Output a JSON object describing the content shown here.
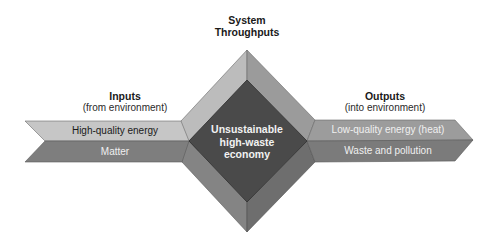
{
  "diagram": {
    "center": {
      "title_line1": "System",
      "title_line2": "Throughputs",
      "box_line1": "Unsustainable",
      "box_line2": "high-waste",
      "box_line3": "economy"
    },
    "inputs": {
      "title": "Inputs",
      "subtitle": "(from environment)",
      "bands": [
        {
          "label": "High-quality energy"
        },
        {
          "label": "Matter"
        }
      ]
    },
    "outputs": {
      "title": "Outputs",
      "subtitle": "(into environment)",
      "bands": [
        {
          "label": "Low-quality energy (heat)"
        },
        {
          "label": "Waste and pollution"
        }
      ]
    },
    "colors": {
      "light_band": "#c4c4c4",
      "medium_band": "#7d7d7d",
      "outer_top_left": "#bdbdbd",
      "outer_top_right": "#9a9a9a",
      "outer_bottom_left": "#858585",
      "outer_bottom_right": "#6f6f6f",
      "inner_diamond": "#4a4a4a",
      "output_top_band": "#9a9a9a",
      "output_bottom_band": "#7a7a7a"
    }
  }
}
